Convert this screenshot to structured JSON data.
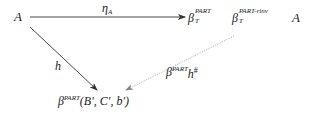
{
  "diagram": {
    "type": "commutative-diagram",
    "nodes": {
      "top_left": {
        "text": "A"
      },
      "top_right": {
        "beta1": "β",
        "beta1_sup": "PART",
        "beta1_sub": "T",
        "beta2": "β",
        "beta2_sup": "PART-rinv",
        "beta2_sub": "T",
        "tail": "A"
      },
      "bottom": {
        "beta": "β",
        "sup": "PART",
        "args": "(B′, C′, b′)"
      }
    },
    "arrows": {
      "top": {
        "label_main": "η",
        "label_sub": "A",
        "style": "solid"
      },
      "diagonal": {
        "label": "h",
        "style": "solid"
      },
      "dotted": {
        "label_beta": "β",
        "label_sup": "PART",
        "label_h": "h",
        "label_h_sup": "#",
        "style": "dotted"
      }
    },
    "colors": {
      "solid_arrow": "#333333",
      "dotted_arrow": "#999999",
      "text": "#1a1a1a"
    }
  }
}
